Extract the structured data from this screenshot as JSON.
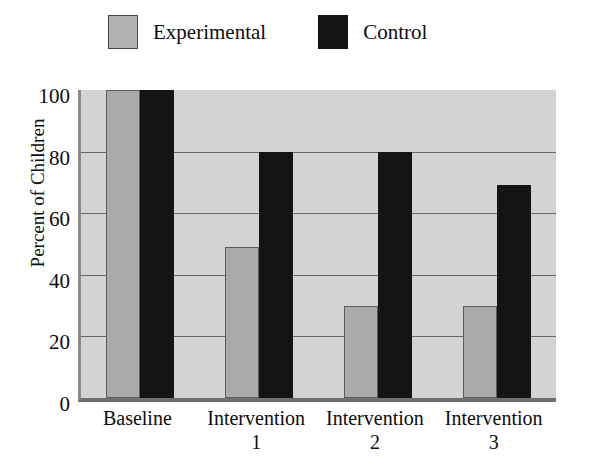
{
  "chart_data": {
    "type": "bar",
    "title": "",
    "xlabel": "",
    "ylabel": "Percent of Children",
    "categories": [
      "Baseline",
      "Intervention\n1",
      "Intervention\n2",
      "Intervention\n3"
    ],
    "series": [
      {
        "name": "Experimental",
        "color": "#aaaaaa",
        "values": [
          100,
          49,
          30,
          30
        ]
      },
      {
        "name": "Control",
        "color": "#141414",
        "values": [
          100,
          80,
          80,
          69
        ]
      }
    ],
    "ylim": [
      0,
      100
    ],
    "yticks": [
      100,
      80,
      60,
      40,
      20,
      0
    ],
    "ytick_labels": [
      "100",
      "80",
      "60",
      "40",
      "20",
      "0"
    ],
    "grid": true,
    "legend_position": "top",
    "plot_background": "#d3d3d3"
  },
  "legend": {
    "entries": [
      {
        "label": "Experimental",
        "swatch": "gray-swatch"
      },
      {
        "label": "Control",
        "swatch": "black-swatch"
      }
    ]
  }
}
